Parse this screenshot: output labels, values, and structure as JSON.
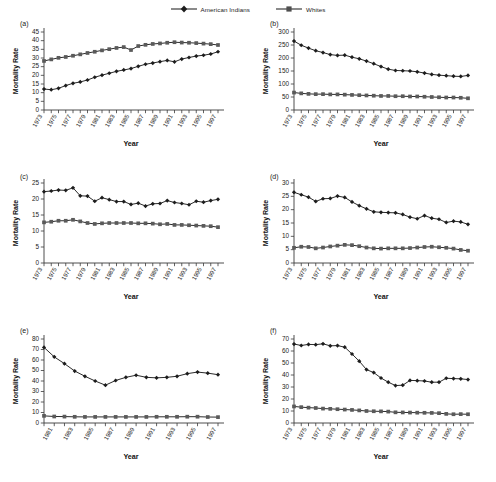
{
  "legend": {
    "items": [
      {
        "label": "American Indians",
        "marker": "diamond",
        "color": "#222222"
      },
      {
        "label": "Whites",
        "marker": "square",
        "color": "#5a5a5a"
      }
    ]
  },
  "axis_labels": {
    "x": "Year",
    "y": "Mortality Rate"
  },
  "chart_data": [
    {
      "type": "line",
      "panel": "(a)",
      "title": "",
      "xlabel": "Year",
      "ylabel": "Mortality Rate",
      "ylim": [
        0,
        45
      ],
      "yticks": [
        0,
        5,
        10,
        15,
        20,
        25,
        30,
        35,
        40,
        45
      ],
      "grid": false,
      "legend_position": "top-center",
      "x": [
        1973,
        1974,
        1975,
        1976,
        1977,
        1978,
        1979,
        1980,
        1981,
        1982,
        1983,
        1984,
        1985,
        1986,
        1987,
        1988,
        1989,
        1990,
        1991,
        1992,
        1993,
        1994,
        1995,
        1996,
        1997
      ],
      "xtick_labels": [
        "1973",
        "1975",
        "1977",
        "1979",
        "1981",
        "1983",
        "1985",
        "1987",
        "1989",
        "1991",
        "1993",
        "1995",
        "1997"
      ],
      "series": [
        {
          "name": "American Indians",
          "marker": "diamond",
          "values": [
            12.1,
            11.7,
            12.5,
            14.1,
            15.4,
            16.2,
            17.3,
            18.9,
            20.1,
            21.2,
            22.3,
            23.1,
            23.9,
            25.2,
            26.4,
            27.1,
            27.9,
            28.6,
            27.8,
            29.4,
            30.3,
            31.1,
            31.6,
            32.3,
            33.6
          ]
        },
        {
          "name": "Whites",
          "marker": "square",
          "values": [
            28.3,
            29.2,
            30.1,
            30.6,
            31.3,
            32.1,
            32.9,
            33.6,
            34.4,
            35.1,
            35.8,
            36.3,
            34.6,
            36.9,
            37.6,
            38.1,
            38.4,
            38.8,
            39.1,
            38.9,
            38.8,
            38.6,
            38.3,
            38.0,
            37.5
          ]
        }
      ]
    },
    {
      "type": "line",
      "panel": "(b)",
      "title": "",
      "xlabel": "Year",
      "ylabel": "Mortality Rate",
      "ylim": [
        0,
        300
      ],
      "yticks": [
        0,
        50,
        100,
        150,
        200,
        250,
        300
      ],
      "grid": false,
      "x": [
        1973,
        1974,
        1975,
        1976,
        1977,
        1978,
        1979,
        1980,
        1981,
        1982,
        1983,
        1984,
        1985,
        1986,
        1987,
        1988,
        1989,
        1990,
        1991,
        1992,
        1993,
        1994,
        1995,
        1996,
        1997
      ],
      "xtick_labels": [
        "1973",
        "1975",
        "1977",
        "1979",
        "1981",
        "1983",
        "1985",
        "1987",
        "1989",
        "1991",
        "1993",
        "1995",
        "1997"
      ],
      "series": [
        {
          "name": "American Indians",
          "marker": "diamond",
          "values": [
            265,
            249,
            238,
            228,
            221,
            213,
            210,
            211,
            203,
            197,
            188,
            178,
            167,
            157,
            152,
            151,
            150,
            147,
            142,
            137,
            134,
            132,
            130,
            129,
            133
          ]
        },
        {
          "name": "Whites",
          "marker": "square",
          "values": [
            67,
            64,
            62,
            61,
            61,
            60,
            60,
            59,
            58,
            57,
            56,
            55,
            54,
            54,
            53,
            53,
            52,
            52,
            51,
            50,
            49,
            48,
            48,
            47,
            45
          ]
        }
      ]
    },
    {
      "type": "line",
      "panel": "(c)",
      "title": "",
      "xlabel": "Year",
      "ylabel": "Mortality Rate",
      "ylim": [
        0,
        25
      ],
      "yticks": [
        0,
        5,
        10,
        15,
        20,
        25
      ],
      "grid": false,
      "x": [
        1973,
        1974,
        1975,
        1976,
        1977,
        1978,
        1979,
        1980,
        1981,
        1982,
        1983,
        1984,
        1985,
        1986,
        1987,
        1988,
        1989,
        1990,
        1991,
        1992,
        1993,
        1994,
        1995,
        1996,
        1997
      ],
      "xtick_labels": [
        "1973",
        "1975",
        "1977",
        "1979",
        "1981",
        "1983",
        "1985",
        "1987",
        "1989",
        "1991",
        "1993",
        "1995",
        "1997"
      ],
      "series": [
        {
          "name": "American Indians",
          "marker": "diamond",
          "values": [
            22.3,
            22.5,
            22.8,
            22.7,
            23.5,
            21.0,
            20.9,
            19.3,
            20.4,
            19.8,
            19.2,
            19.2,
            18.3,
            18.7,
            17.8,
            18.5,
            18.6,
            19.5,
            18.9,
            18.6,
            18.2,
            19.3,
            19.0,
            19.5,
            19.9
          ]
        },
        {
          "name": "Whites",
          "marker": "square",
          "values": [
            12.7,
            12.9,
            13.2,
            13.2,
            13.5,
            13.0,
            12.5,
            12.2,
            12.4,
            12.5,
            12.5,
            12.5,
            12.5,
            12.4,
            12.4,
            12.3,
            12.1,
            12.2,
            11.9,
            11.9,
            11.8,
            11.7,
            11.6,
            11.5,
            11.2
          ]
        }
      ]
    },
    {
      "type": "line",
      "panel": "(d)",
      "title": "",
      "xlabel": "Year",
      "ylabel": "Mortality Rate",
      "ylim": [
        0,
        30
      ],
      "yticks": [
        0,
        5,
        10,
        15,
        20,
        25,
        30
      ],
      "grid": false,
      "x": [
        1973,
        1974,
        1975,
        1976,
        1977,
        1978,
        1979,
        1980,
        1981,
        1982,
        1983,
        1984,
        1985,
        1986,
        1987,
        1988,
        1989,
        1990,
        1991,
        1992,
        1993,
        1994,
        1995,
        1996,
        1997
      ],
      "xtick_labels": [
        "1973",
        "1975",
        "1977",
        "1979",
        "1981",
        "1983",
        "1985",
        "1987",
        "1989",
        "1991",
        "1993",
        "1995",
        "1997"
      ],
      "series": [
        {
          "name": "American Indians",
          "marker": "diamond",
          "values": [
            26.5,
            25.6,
            24.7,
            23.1,
            24.1,
            24.2,
            25.1,
            24.6,
            22.9,
            21.5,
            20.3,
            19.2,
            19.0,
            18.9,
            18.8,
            18.2,
            17.2,
            16.6,
            17.8,
            16.8,
            16.4,
            15.2,
            15.7,
            15.4,
            14.5
          ]
        },
        {
          "name": "Whites",
          "marker": "square",
          "values": [
            5.7,
            6.1,
            6.0,
            5.5,
            5.8,
            6.2,
            6.5,
            6.8,
            6.7,
            6.3,
            5.8,
            5.5,
            5.4,
            5.5,
            5.5,
            5.5,
            5.6,
            5.8,
            6.0,
            6.1,
            5.9,
            5.7,
            5.4,
            4.9,
            4.6
          ]
        }
      ]
    },
    {
      "type": "line",
      "panel": "(e)",
      "title": "",
      "xlabel": "Year",
      "ylabel": "Mortality Rate",
      "ylim": [
        0,
        80
      ],
      "yticks": [
        0,
        10,
        20,
        30,
        40,
        50,
        60,
        70,
        80
      ],
      "grid": false,
      "x": [
        1980,
        1981,
        1982,
        1983,
        1984,
        1985,
        1986,
        1987,
        1988,
        1989,
        1990,
        1991,
        1992,
        1993,
        1994,
        1995,
        1996,
        1997
      ],
      "xtick_labels": [
        "1981",
        "1983",
        "1985",
        "1987",
        "1989",
        "1991",
        "1993",
        "1995",
        "1997"
      ],
      "series": [
        {
          "name": "American Indians",
          "marker": "diamond",
          "values": [
            72,
            63,
            56.5,
            49.5,
            44.5,
            40,
            36,
            40.5,
            43.5,
            45.5,
            43.5,
            43,
            43.5,
            44.5,
            47,
            48.5,
            47.5,
            46
          ]
        },
        {
          "name": "Whites",
          "marker": "square",
          "values": [
            6.8,
            6.2,
            6.1,
            5.9,
            5.8,
            5.8,
            5.8,
            5.8,
            5.8,
            5.8,
            5.8,
            5.9,
            5.9,
            5.9,
            6.0,
            6.0,
            5.7,
            5.6
          ]
        }
      ]
    },
    {
      "type": "line",
      "panel": "(f)",
      "title": "",
      "xlabel": "Year",
      "ylabel": "Mortality Rate",
      "ylim": [
        0,
        70
      ],
      "yticks": [
        0,
        10,
        20,
        30,
        40,
        50,
        60,
        70
      ],
      "grid": false,
      "x": [
        1973,
        1974,
        1975,
        1976,
        1977,
        1978,
        1979,
        1980,
        1981,
        1982,
        1983,
        1984,
        1985,
        1986,
        1987,
        1988,
        1989,
        1990,
        1991,
        1992,
        1993,
        1994,
        1995,
        1996,
        1997
      ],
      "xtick_labels": [
        "1973",
        "1975",
        "1977",
        "1979",
        "1981",
        "1983",
        "1985",
        "1987",
        "1989",
        "1991",
        "1993",
        "1995",
        "1997"
      ],
      "series": [
        {
          "name": "American Indians",
          "marker": "diamond",
          "values": [
            65.8,
            64.6,
            65.5,
            65.3,
            66.0,
            64.3,
            64.5,
            63.2,
            57.5,
            51.5,
            44.5,
            42.0,
            37.5,
            34.0,
            31.2,
            31.5,
            35.5,
            35.3,
            35.0,
            34.0,
            34.0,
            37.3,
            37.0,
            36.8,
            36.2
          ]
        },
        {
          "name": "Whites",
          "marker": "square",
          "values": [
            13.8,
            13.2,
            12.8,
            12.5,
            12.0,
            11.8,
            11.5,
            11.2,
            10.9,
            10.5,
            10.0,
            9.8,
            9.7,
            9.5,
            8.9,
            8.8,
            8.7,
            8.6,
            8.5,
            8.4,
            8.2,
            7.6,
            7.3,
            7.4,
            7.3
          ]
        }
      ]
    }
  ]
}
